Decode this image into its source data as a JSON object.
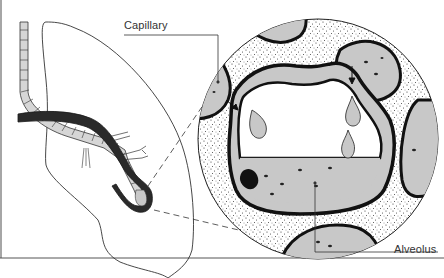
{
  "figure": {
    "type": "anatomical-illustration",
    "labels": {
      "capillary": "Capillary",
      "alveolus": "Alveolus"
    },
    "colors": {
      "outline": "#1a1a1a",
      "tissue_fill": "#c8c8c8",
      "bronchus_fill": "#d6d6d6",
      "vessel_fill": "#2a2a2a",
      "background": "#ffffff",
      "frame_border": "#888888"
    },
    "parts": [
      "lung-outline",
      "bronchus",
      "pulmonary-vessel",
      "terminal-alveolus",
      "magnified-circle",
      "alveolar-sac",
      "capillaries",
      "fluid-droplets",
      "fluid-level"
    ]
  }
}
